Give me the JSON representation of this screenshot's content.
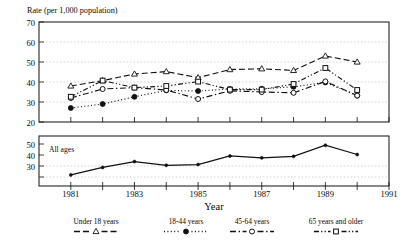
{
  "figure": {
    "axis_title_top": "Rate (per 1,000 population)",
    "xaxis_title": "Year",
    "lower_panel_note": "All ages",
    "footnote": ""
  },
  "chart_data": {
    "type": "line",
    "title": "Rate (per 1,000 population)",
    "xlabel": "Year",
    "ylabel": "Rate (per 1,000 population)",
    "panels": [
      {
        "name": "by-age-group",
        "ylim": [
          20,
          70
        ],
        "yticks": [
          20,
          30,
          40,
          50,
          60,
          70
        ],
        "xlim": [
          1980,
          1991
        ],
        "xticks": [
          1981,
          1983,
          1985,
          1987,
          1989,
          1991
        ],
        "x": [
          1981,
          1982,
          1983,
          1984,
          1985,
          1986,
          1987,
          1988,
          1989,
          1990
        ],
        "grid": true,
        "series": [
          {
            "name": "Under 18 years",
            "marker": "triangle-open",
            "dash": "6 3",
            "values": [
              38.0,
              40.7,
              44.0,
              45.2,
              42.2,
              46.2,
              46.6,
              45.8,
              53.0,
              50.0
            ]
          },
          {
            "name": "18-44 years",
            "marker": "circle-filled",
            "dash": "1 2.4",
            "values": [
              27.0,
              29.0,
              32.6,
              35.8,
              35.5,
              36.5,
              36.6,
              37.6,
              39.8,
              33.2
            ]
          },
          {
            "name": "45-64 years",
            "marker": "circle-open",
            "dash": "6 2.6 1.4 2.6",
            "values": [
              32.0,
              36.5,
              37.2,
              36.0,
              31.5,
              35.6,
              35.0,
              34.6,
              40.3,
              33.2
            ]
          },
          {
            "name": "65 years and older",
            "marker": "square-open",
            "dash": "5 2.2 1.2 2.2 1.2 2.2",
            "values": [
              32.6,
              40.7,
              37.2,
              38.0,
              40.2,
              36.2,
              36.2,
              39.0,
              47.0,
              36.0
            ]
          }
        ]
      },
      {
        "name": "all-ages",
        "ylim": [
          25,
          52
        ],
        "yticks": [
          30,
          40,
          50
        ],
        "xlim": [
          1980,
          1991
        ],
        "xticks": [
          1981,
          1983,
          1985,
          1987,
          1989,
          1991
        ],
        "grid": true,
        "x": [
          1981,
          1982,
          1983,
          1984,
          1985,
          1986,
          1987,
          1988,
          1989,
          1990
        ],
        "series": [
          {
            "name": "All ages",
            "marker": "dot-filled",
            "dash": "none",
            "values": [
              31.0,
              35.0,
              38.2,
              36.2,
              36.6,
              41.2,
              40.2,
              41.0,
              47.0,
              42.0
            ]
          }
        ]
      }
    ],
    "legend": {
      "position": "bottom",
      "entries": [
        {
          "label": "Under 18 years",
          "marker": "triangle-open",
          "dash": "6 3"
        },
        {
          "label": "18-44 years",
          "marker": "circle-filled",
          "dash": "1 2.4"
        },
        {
          "label": "45-64 years",
          "marker": "circle-open",
          "dash": "6 2.6 1.4 2.6"
        },
        {
          "label": "65 years and older",
          "marker": "square-open",
          "dash": "5 2.2 1.2 2.2 1.2 2.2"
        }
      ]
    }
  },
  "axis_labels": {
    "top_yticks": [
      "70",
      "60",
      "50",
      "40",
      "30",
      "20"
    ],
    "bottom_yticks": [
      "50",
      "40",
      "30"
    ],
    "xticks": [
      "1981",
      "1983",
      "1985",
      "1987",
      "1989",
      "1991"
    ]
  }
}
